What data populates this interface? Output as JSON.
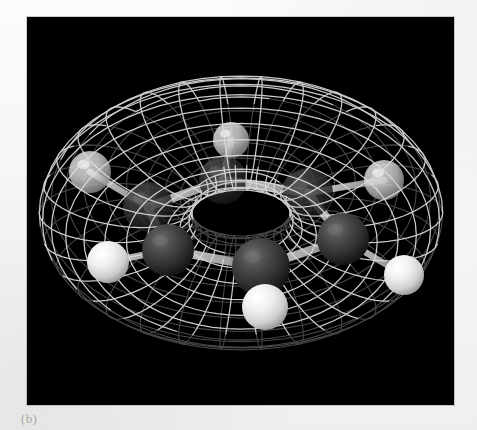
{
  "figure": {
    "caption": "(b)",
    "panel_background": "#000000",
    "page_background": "#f7f7f5",
    "mesh_color": "#d8d8d8",
    "carbon_color": "#3a3a3a",
    "hydrogen_color": "#f2f2f2",
    "bond_color": "#cccccc"
  },
  "chart_data": {
    "type": "scatter",
    "title": "",
    "subtitle": "",
    "xlabel": "",
    "ylabel": "",
    "legend_position": "none",
    "grid": false,
    "render_style": "3d-ball-and-stick-with-wireframe-isosurface",
    "isosurface": {
      "shape": "torus",
      "label": "pi molecular orbital",
      "lobes": 2,
      "lobe_labels": [
        "upper lobe",
        "lower lobe"
      ],
      "wireframe": true,
      "mesh_u_lines": 30,
      "mesh_v_lines": 22,
      "center": [
        214,
        196
      ],
      "outer_radius_x": 187,
      "outer_radius_y": 154
    },
    "atoms": [
      {
        "id": "C1",
        "element": "C",
        "label": "carbon",
        "x": 121,
        "y": 190,
        "r": 25,
        "depth": "back"
      },
      {
        "id": "C2",
        "element": "C",
        "label": "carbon",
        "x": 196,
        "y": 163,
        "r": 24,
        "depth": "back"
      },
      {
        "id": "C3",
        "element": "C",
        "label": "carbon",
        "x": 281,
        "y": 176,
        "r": 25,
        "depth": "back"
      },
      {
        "id": "C4",
        "element": "C",
        "label": "carbon",
        "x": 316,
        "y": 222,
        "r": 26,
        "depth": "mid"
      },
      {
        "id": "C5",
        "element": "C",
        "label": "carbon",
        "x": 234,
        "y": 250,
        "r": 29,
        "depth": "front"
      },
      {
        "id": "C6",
        "element": "C",
        "label": "carbon",
        "x": 141,
        "y": 233,
        "r": 26,
        "depth": "mid"
      },
      {
        "id": "H1",
        "element": "H",
        "label": "hydrogen",
        "x": 63,
        "y": 155,
        "r": 21,
        "depth": "back"
      },
      {
        "id": "H2",
        "element": "H",
        "label": "hydrogen",
        "x": 204,
        "y": 123,
        "r": 18,
        "depth": "back"
      },
      {
        "id": "H3",
        "element": "H",
        "label": "hydrogen",
        "x": 357,
        "y": 163,
        "r": 20,
        "depth": "back"
      },
      {
        "id": "H4",
        "element": "H",
        "label": "hydrogen",
        "x": 377,
        "y": 258,
        "r": 20,
        "depth": "front"
      },
      {
        "id": "H5",
        "element": "H",
        "label": "hydrogen",
        "x": 238,
        "y": 290,
        "r": 23,
        "depth": "front"
      },
      {
        "id": "H6",
        "element": "H",
        "label": "hydrogen",
        "x": 81,
        "y": 245,
        "r": 21,
        "depth": "front"
      }
    ],
    "bonds": [
      {
        "from": "C1",
        "to": "C2"
      },
      {
        "from": "C2",
        "to": "C3"
      },
      {
        "from": "C3",
        "to": "C4"
      },
      {
        "from": "C4",
        "to": "C5"
      },
      {
        "from": "C5",
        "to": "C6"
      },
      {
        "from": "C6",
        "to": "C1"
      },
      {
        "from": "C1",
        "to": "H1"
      },
      {
        "from": "C2",
        "to": "H2"
      },
      {
        "from": "C3",
        "to": "H3"
      },
      {
        "from": "C4",
        "to": "H4"
      },
      {
        "from": "C5",
        "to": "H5"
      },
      {
        "from": "C6",
        "to": "H6"
      }
    ]
  }
}
